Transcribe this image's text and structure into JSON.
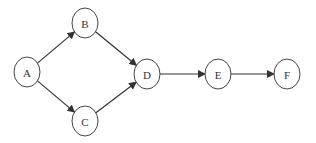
{
  "diagram": {
    "type": "directed-graph",
    "nodes": [
      {
        "id": "A",
        "label": "A",
        "cx": 27,
        "cy": 72
      },
      {
        "id": "B",
        "label": "B",
        "cx": 85,
        "cy": 23
      },
      {
        "id": "C",
        "label": "C",
        "cx": 85,
        "cy": 121
      },
      {
        "id": "D",
        "label": "D",
        "cx": 147,
        "cy": 74
      },
      {
        "id": "E",
        "label": "E",
        "cx": 218,
        "cy": 74
      },
      {
        "id": "F",
        "label": "F",
        "cx": 287,
        "cy": 74
      }
    ],
    "edges": [
      {
        "from": "A",
        "to": "B"
      },
      {
        "from": "A",
        "to": "C"
      },
      {
        "from": "B",
        "to": "D"
      },
      {
        "from": "C",
        "to": "D"
      },
      {
        "from": "D",
        "to": "E"
      },
      {
        "from": "E",
        "to": "F"
      }
    ],
    "node_rx": 13,
    "node_ry": 15,
    "colors": {
      "stroke": "#444444",
      "edge": "#333333",
      "label": "#333333",
      "background": "#ffffff"
    }
  }
}
